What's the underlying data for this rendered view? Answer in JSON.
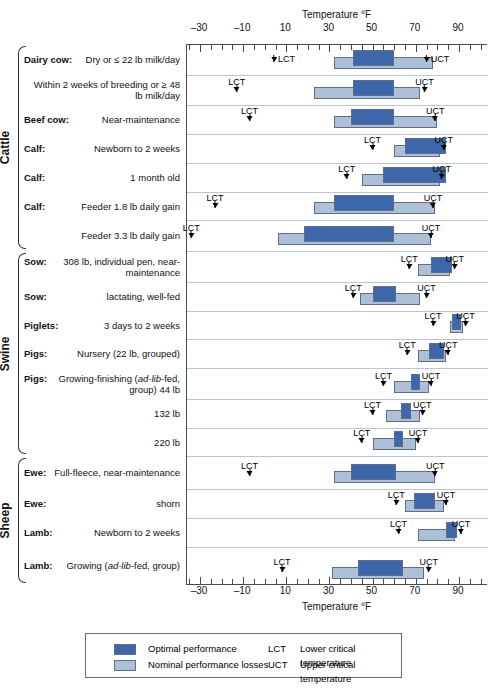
{
  "axis": {
    "title_top": "Temperature °F",
    "title_bottom": "Temperature °F",
    "ticks": [
      -30,
      -10,
      10,
      30,
      50,
      70,
      90
    ],
    "tick_labels": [
      "–30",
      "–10",
      "10",
      "30",
      "50",
      "70",
      "90"
    ],
    "min": -40,
    "max": 100
  },
  "legend": {
    "optimal_label": "Optimal performance",
    "nominal_label": "Nominal performance losses",
    "lct_abbr": "LCT",
    "lct_def": "Lower critical temperature",
    "uct_abbr": "UCT",
    "uct_def": "Upper critical temperature"
  },
  "colors": {
    "optimal": "#3e67ab",
    "nominal": "#aebfd8",
    "row_divider": "#b9c6d8",
    "frame": "#4a4a4a"
  },
  "groups": [
    {
      "name": "Cattle",
      "first_row": 0,
      "last_row": 6
    },
    {
      "name": "Swine",
      "first_row": 7,
      "last_row": 13
    },
    {
      "name": "Sheep",
      "first_row": 14,
      "last_row": 17
    }
  ],
  "marker_labels": {
    "lct": "LCT",
    "uct": "UCT"
  },
  "chart_data": {
    "type": "bar",
    "xlabel": "Temperature °F",
    "ylabel": "",
    "xlim": [
      -40,
      100
    ],
    "grid": false,
    "legend_position": "bottom",
    "series": [
      {
        "name": "Optimal performance",
        "color": "#3e67ab"
      },
      {
        "name": "Nominal performance losses",
        "color": "#aebfd8"
      }
    ],
    "categories": [
      "Dairy cow: Dry or ≤ 22 lb milk/day",
      "Dairy cow: Within 2 weeks of breeding or ≥ 48 lb milk/day",
      "Beef cow: Near-maintenance",
      "Calf: Newborn to 2 weeks",
      "Calf: 1 month old",
      "Calf: Feeder 1.8 lb daily gain",
      "Calf: Feeder 3.3 lb daily gain",
      "Sow: 308 lb, individual pen, near-maintenance",
      "Sow: lactating, well-fed",
      "Piglets: 3 days to 2 weeks",
      "Pigs: Nursery (22 lb, grouped)",
      "Pigs: Growing-finishing (ad-lib-fed, group) 44 lb",
      "Pigs: Growing-finishing (ad-lib-fed, group) 132 lb",
      "Pigs: Growing-finishing (ad-lib-fed, group) 220 lb",
      "Ewe: Full-fleece, near-maintenance",
      "Ewe: shorn",
      "Lamb: Newborn to 2 weeks",
      "Lamb: Growing (ad-lib-fed, group)"
    ],
    "rows": [
      {
        "group": "Cattle",
        "label_lead": "Dairy cow:",
        "label_rest": "Dry or ≤ 22 lb milk/day",
        "nominal": [
          32,
          78
        ],
        "optimal": [
          41,
          60
        ],
        "lct": 6,
        "uct": 77,
        "lct_style": "inline",
        "uct_style": "inline"
      },
      {
        "group": "Cattle",
        "label_lead": "",
        "label_rest": "Within 2 weeks of breeding or ≥ 48 lb milk/day",
        "nominal": [
          23,
          72
        ],
        "optimal": [
          41,
          60
        ],
        "lct": -13,
        "uct": 74,
        "lct_style": "stacked",
        "uct_style": "stacked"
      },
      {
        "group": "Cattle",
        "label_lead": "Beef cow:",
        "label_rest": "Near-maintenance",
        "nominal": [
          32,
          80
        ],
        "optimal": [
          40,
          60
        ],
        "lct": -7,
        "uct": 79,
        "lct_style": "stacked",
        "uct_style": "stacked"
      },
      {
        "group": "Cattle",
        "label_lead": "Calf:",
        "label_rest": "Newborn to 2 weeks",
        "nominal": [
          60,
          81
        ],
        "optimal": [
          65,
          84
        ],
        "lct": 50,
        "uct": 83,
        "lct_style": "stacked",
        "uct_style": "stacked"
      },
      {
        "group": "Cattle",
        "label_lead": "Calf:",
        "label_rest": "1 month old",
        "nominal": [
          45,
          81
        ],
        "optimal": [
          55,
          84
        ],
        "lct": 38,
        "uct": 82,
        "lct_style": "stacked",
        "uct_style": "stacked"
      },
      {
        "group": "Cattle",
        "label_lead": "Calf:",
        "label_rest": "Feeder 1.8 lb daily gain",
        "nominal": [
          23,
          79
        ],
        "optimal": [
          32,
          60
        ],
        "lct": -23,
        "uct": 78,
        "lct_style": "stacked",
        "uct_style": "stacked"
      },
      {
        "group": "Cattle",
        "label_lead": "",
        "label_rest": "Feeder 3.3 lb daily gain",
        "nominal": [
          6,
          77
        ],
        "optimal": [
          18,
          60
        ],
        "lct": -34,
        "uct": 77,
        "lct_style": "stacked",
        "uct_style": "stacked"
      },
      {
        "group": "Swine",
        "label_lead": "Sow:",
        "label_rest": "308 lb, individual pen, near-maintenance",
        "nominal": [
          71,
          86
        ],
        "optimal": [
          77,
          87
        ],
        "lct": 67,
        "uct": 88,
        "lct_style": "stacked",
        "uct_style": "stacked"
      },
      {
        "group": "Swine",
        "label_lead": "Sow:",
        "label_rest": "lactating, well-fed",
        "nominal": [
          44,
          72
        ],
        "optimal": [
          50,
          61
        ],
        "lct": 41,
        "uct": 75,
        "lct_style": "stacked",
        "uct_style": "stacked"
      },
      {
        "group": "Swine",
        "label_lead": "Piglets:",
        "label_rest": "3 days to 2 weeks",
        "nominal": [
          86,
          92
        ],
        "optimal": [
          87,
          91
        ],
        "lct": 78,
        "uct": 93,
        "lct_style": "stacked",
        "uct_style": "stacked"
      },
      {
        "group": "Swine",
        "label_lead": "Pigs:",
        "label_rest": "Nursery (22 lb, grouped)",
        "nominal": [
          71,
          84
        ],
        "optimal": [
          76,
          83
        ],
        "lct": 66,
        "uct": 85,
        "lct_style": "stacked",
        "uct_style": "stacked"
      },
      {
        "group": "Swine",
        "label_lead": "Pigs:",
        "label_rest": "Growing-finishing (ad-lib-fed, group) 44 lb",
        "nominal": [
          60,
          76
        ],
        "optimal": [
          68,
          72
        ],
        "lct": 55,
        "uct": 77,
        "lct_style": "stacked",
        "uct_style": "stacked"
      },
      {
        "group": "Swine",
        "label_lead": "",
        "label_rest": "132 lb",
        "nominal": [
          56,
          72
        ],
        "optimal": [
          63,
          68
        ],
        "lct": 50,
        "uct": 73,
        "lct_style": "stacked",
        "uct_style": "stacked"
      },
      {
        "group": "Swine",
        "label_lead": "",
        "label_rest": "220 lb",
        "nominal": [
          50,
          70
        ],
        "optimal": [
          60,
          64
        ],
        "lct": 45,
        "uct": 71,
        "lct_style": "stacked",
        "uct_style": "stacked"
      },
      {
        "group": "Sheep",
        "label_lead": "Ewe:",
        "label_rest": "Full-fleece, near-maintenance",
        "nominal": [
          32,
          79
        ],
        "optimal": [
          40,
          61
        ],
        "lct": -7,
        "uct": 79,
        "lct_style": "stacked",
        "uct_style": "stacked"
      },
      {
        "group": "Sheep",
        "label_lead": "Ewe:",
        "label_rest": "shorn",
        "nominal": [
          65,
          83
        ],
        "optimal": [
          69,
          79
        ],
        "lct": 61,
        "uct": 84,
        "lct_style": "stacked",
        "uct_style": "stacked"
      },
      {
        "group": "Sheep",
        "label_lead": "Lamb:",
        "label_rest": "Newborn to 2 weeks",
        "nominal": [
          71,
          88
        ],
        "optimal": [
          84,
          89
        ],
        "lct": 62,
        "uct": 91,
        "lct_style": "stacked",
        "uct_style": "stacked"
      },
      {
        "group": "Sheep",
        "label_lead": "Lamb:",
        "label_rest": "Growing (ad-lib-fed, group)",
        "nominal": [
          31,
          74
        ],
        "optimal": [
          43,
          64
        ],
        "lct": 8,
        "uct": 76,
        "lct_style": "stacked",
        "uct_style": "stacked"
      }
    ]
  }
}
